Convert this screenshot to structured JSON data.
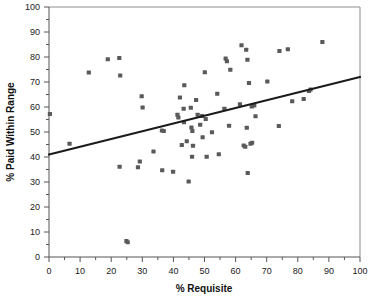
{
  "chart_data": {
    "type": "scatter",
    "title": "",
    "xlabel": "% Requisite",
    "ylabel": "% Paid Within Range",
    "xlim": [
      0,
      100
    ],
    "ylim": [
      0,
      100
    ],
    "xticks": [
      0,
      10,
      20,
      30,
      40,
      50,
      60,
      70,
      80,
      90,
      100
    ],
    "yticks": [
      0,
      10,
      20,
      30,
      40,
      50,
      60,
      70,
      80,
      90,
      100
    ],
    "xtick_labels": [
      "0",
      "10",
      "20",
      "30",
      "40",
      "50",
      "60",
      "70",
      "80",
      "90",
      "100"
    ],
    "ytick_labels": [
      "0",
      "10",
      "20",
      "30",
      "40",
      "50",
      "60",
      "70",
      "80",
      "90",
      "100"
    ],
    "grid": false,
    "legend": null,
    "marker": {
      "shape": "square",
      "color": "#5a5a5a",
      "size_px": 4.2
    },
    "trendline": {
      "type": "linear",
      "color": "#1b1b1b",
      "x": [
        0,
        100
      ],
      "y": [
        41,
        72
      ]
    },
    "points": [
      [
        0.3,
        57.2
      ],
      [
        6.6,
        45.3
      ],
      [
        12.8,
        73.8
      ],
      [
        18.9,
        79.1
      ],
      [
        22.6,
        79.6
      ],
      [
        22.9,
        72.6
      ],
      [
        22.7,
        36.1
      ],
      [
        24.9,
        6.4
      ],
      [
        25.3,
        5.9
      ],
      [
        28.6,
        35.9
      ],
      [
        29.2,
        38.2
      ],
      [
        29.8,
        64.3
      ],
      [
        30.1,
        59.8
      ],
      [
        33.6,
        42.2
      ],
      [
        36.3,
        50.6
      ],
      [
        36.9,
        50.4
      ],
      [
        36.4,
        34.7
      ],
      [
        39.9,
        34.1
      ],
      [
        41.3,
        56.9
      ],
      [
        41.6,
        55.8
      ],
      [
        42.1,
        63.8
      ],
      [
        42.7,
        44.8
      ],
      [
        43.3,
        59.3
      ],
      [
        43.5,
        68.7
      ],
      [
        43.4,
        53.9
      ],
      [
        44.3,
        46.3
      ],
      [
        44.9,
        30.2
      ],
      [
        45.6,
        59.7
      ],
      [
        45.8,
        51.8
      ],
      [
        46.1,
        50.4
      ],
      [
        46.3,
        44.5
      ],
      [
        46.0,
        40.1
      ],
      [
        47.3,
        62.8
      ],
      [
        47.8,
        56.9
      ],
      [
        48.6,
        52.9
      ],
      [
        49.2,
        56.4
      ],
      [
        49.4,
        47.9
      ],
      [
        50.1,
        73.9
      ],
      [
        50.4,
        55.2
      ],
      [
        50.7,
        40.1
      ],
      [
        52.4,
        49.9
      ],
      [
        54.1,
        65.3
      ],
      [
        54.6,
        41.1
      ],
      [
        56.4,
        59.3
      ],
      [
        56.8,
        79.4
      ],
      [
        57.2,
        78.3
      ],
      [
        57.9,
        52.5
      ],
      [
        58.3,
        74.9
      ],
      [
        61.4,
        61.1
      ],
      [
        61.9,
        84.7
      ],
      [
        62.6,
        44.6
      ],
      [
        63.1,
        44.1
      ],
      [
        63.4,
        82.9
      ],
      [
        63.6,
        51.7
      ],
      [
        63.8,
        78.9
      ],
      [
        63.9,
        33.6
      ],
      [
        64.3,
        69.6
      ],
      [
        64.8,
        45.3
      ],
      [
        65.3,
        45.7
      ],
      [
        65.2,
        60.2
      ],
      [
        66.4,
        56.3
      ],
      [
        66.0,
        60.6
      ],
      [
        70.2,
        70.2
      ],
      [
        73.9,
        52.4
      ],
      [
        74.1,
        82.4
      ],
      [
        76.8,
        83.1
      ],
      [
        78.2,
        62.3
      ],
      [
        81.9,
        63.2
      ],
      [
        83.6,
        66.4
      ],
      [
        84.1,
        67.0
      ],
      [
        87.9,
        86.0
      ]
    ]
  }
}
